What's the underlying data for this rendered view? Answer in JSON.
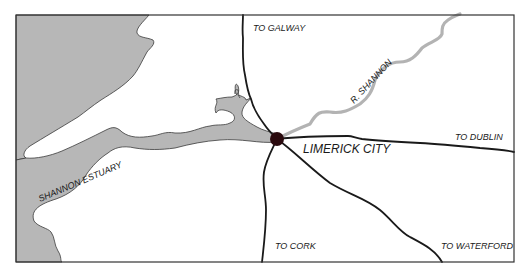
{
  "map": {
    "colors": {
      "background": "#ffffff",
      "water": "#b7b7b7",
      "water_outline": "#3a3a3a",
      "road": "#1a1a1a",
      "river": "#b3b3b3",
      "frame": "#333333",
      "city_marker": "#2a0a0e"
    },
    "city": {
      "name": "LIMERICK CITY",
      "x": 277,
      "y": 139
    },
    "water_bodies": [
      {
        "name": "Shannon Estuary",
        "label": "SHANNON ESTUARY"
      }
    ],
    "river": {
      "name": "River Shannon",
      "label": "R. SHANNON"
    },
    "roads": [
      {
        "id": "galway",
        "label": "TO GALWAY"
      },
      {
        "id": "dublin",
        "label": "TO DUBLIN"
      },
      {
        "id": "cork",
        "label": "TO CORK"
      },
      {
        "id": "waterford",
        "label": "TO WATERFORD"
      }
    ]
  }
}
